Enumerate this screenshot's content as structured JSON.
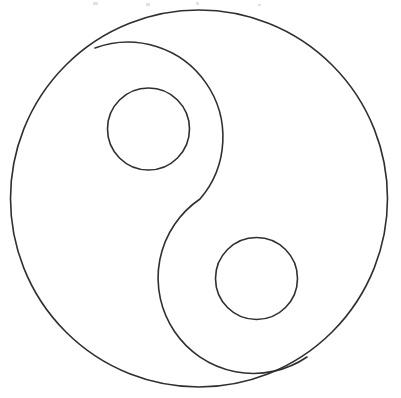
{
  "document": {
    "title": "Yin Yang Line Drawing",
    "kind": "line-art-coloring-page",
    "background_color": "#ffffff",
    "stroke_color": "#2f2f2f",
    "stroke_width": 1.6,
    "canvas": {
      "width": 401,
      "height": 398
    }
  },
  "figure": {
    "name": "yin-yang-symbol",
    "outer_circle": {
      "name": "outer-circle",
      "center_x": 199,
      "center_y": 198.5,
      "radius": 188.5
    },
    "s_curve": {
      "name": "s-curve-divider",
      "upper_lobe": {
        "center_x": 151,
        "center_y": 126,
        "radius": 95,
        "sweep": "clockwise"
      },
      "lower_lobe": {
        "center_x": 250,
        "center_y": 272,
        "radius": 95,
        "sweep": "counter-clockwise"
      },
      "start_x": 95,
      "start_y": 48,
      "mid_x": 200,
      "mid_y": 199,
      "end_x": 307,
      "end_y": 357,
      "path": "M 95 48 A 95 95 0 0 1 200 199 A 95 95 0 0 0 307 357"
    },
    "small_circles": [
      {
        "name": "upper-small-circle",
        "center_x": 148.5,
        "center_y": 129,
        "radius": 41
      },
      {
        "name": "lower-small-circle",
        "center_x": 256.5,
        "center_y": 278.5,
        "radius": 41
      }
    ],
    "specks": [
      {
        "name": "scan-speck-1",
        "x": 93,
        "y": 2,
        "width": 5,
        "height": 3
      },
      {
        "name": "scan-speck-2",
        "x": 146,
        "y": 3,
        "width": 4,
        "height": 3
      },
      {
        "name": "scan-speck-3",
        "x": 196,
        "y": 2,
        "width": 3,
        "height": 3
      },
      {
        "name": "scan-speck-4",
        "x": 258,
        "y": 4,
        "width": 3,
        "height": 2
      }
    ]
  }
}
